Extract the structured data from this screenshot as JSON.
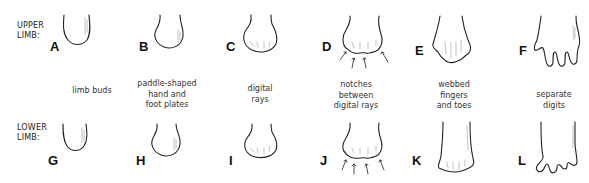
{
  "rows": {
    "upper": {
      "label_line1": "UPPER",
      "label_line2": "LIMB:"
    },
    "lower": {
      "label_line1": "LOWER",
      "label_line2": "LIMB:"
    }
  },
  "stages": [
    {
      "upper_letter": "A",
      "lower_letter": "G",
      "caption": [
        "limb buds"
      ]
    },
    {
      "upper_letter": "B",
      "lower_letter": "H",
      "caption": [
        "paddle-shaped",
        "hand and",
        "foot plates"
      ]
    },
    {
      "upper_letter": "C",
      "lower_letter": "I",
      "caption": [
        "digital",
        "rays"
      ]
    },
    {
      "upper_letter": "D",
      "lower_letter": "J",
      "caption": [
        "notches",
        "between",
        "digital rays"
      ]
    },
    {
      "upper_letter": "E",
      "lower_letter": "K",
      "caption": [
        "webbed",
        "fingers",
        "and toes"
      ]
    },
    {
      "upper_letter": "F",
      "lower_letter": "L",
      "caption": [
        "separate",
        "digits"
      ]
    }
  ]
}
